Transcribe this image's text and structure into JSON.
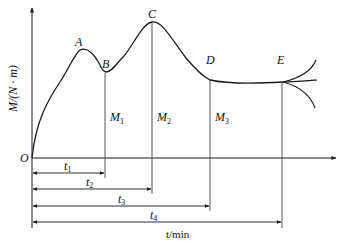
{
  "diagram": {
    "type": "torque-time curve",
    "axes": {
      "origin_label": "O",
      "y_label": "M/(N · m)",
      "x_label": "t/min"
    },
    "points": [
      {
        "label": "A"
      },
      {
        "label": "B"
      },
      {
        "label": "C"
      },
      {
        "label": "D"
      },
      {
        "label": "E"
      }
    ],
    "vertical_markers": [
      {
        "label": "M",
        "sub": "1"
      },
      {
        "label": "M",
        "sub": "2"
      },
      {
        "label": "M",
        "sub": "3"
      }
    ],
    "time_intervals": [
      {
        "label": "t",
        "sub": "1"
      },
      {
        "label": "t",
        "sub": "2"
      },
      {
        "label": "t",
        "sub": "3"
      },
      {
        "label": "t",
        "sub": "4"
      }
    ],
    "colors": {
      "line": "#1a1a1a",
      "guide": "#444444",
      "background": "#ffffff"
    }
  }
}
